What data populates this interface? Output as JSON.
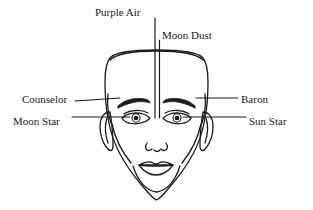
{
  "diagram": {
    "background_color": "#ffffff",
    "line_color": "#1a1a1a",
    "text_color": "#1a1a1a",
    "labels": [
      {
        "id": "purple-air",
        "text": "Purple Air",
        "position": "top-left-of-center",
        "pointer": "vertical-line-down-forehead"
      },
      {
        "id": "moon-dust",
        "text": "Moon Dust",
        "position": "top-right-of-center",
        "pointer": "vertical-line-down-forehead"
      },
      {
        "id": "counselor",
        "text": "Counselor",
        "position": "left",
        "pointer": "leader-line-to-left-eyebrow"
      },
      {
        "id": "moon-star",
        "text": "Moon Star",
        "position": "left",
        "pointer": "leader-line-to-left-eye"
      },
      {
        "id": "baron",
        "text": "Baron",
        "position": "right",
        "pointer": "leader-line-to-right-eyebrow"
      },
      {
        "id": "sun-star",
        "text": "Sun Star",
        "position": "right",
        "pointer": "leader-line-to-right-eye"
      }
    ],
    "features": [
      "head-outline",
      "hairline",
      "left-ear",
      "right-ear",
      "left-eyebrow",
      "right-eyebrow",
      "left-eye",
      "right-eye",
      "nose",
      "lips",
      "jaw",
      "chin",
      "neck"
    ]
  }
}
